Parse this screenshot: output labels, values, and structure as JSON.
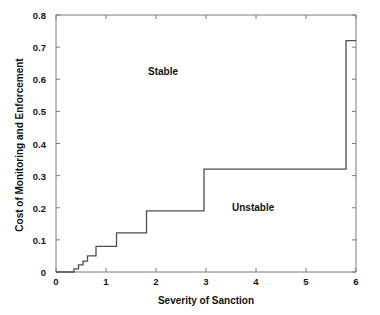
{
  "figure": {
    "width": 380,
    "height": 315,
    "background": "#ffffff",
    "line_color": "#4d4d4d",
    "axis_color": "#7a7a7a",
    "text_color": "#111111"
  },
  "chart_data": {
    "type": "line",
    "subtype": "step",
    "title": "",
    "xlabel": "Severity of Sanction",
    "ylabel": "Cost of Monitoring and Enforcement",
    "xlim": [
      0,
      6
    ],
    "ylim": [
      0,
      0.8
    ],
    "grid": false,
    "legend": null,
    "xticks": [
      0,
      1,
      2,
      3,
      4,
      5,
      6
    ],
    "xtick_labels": [
      "0",
      "1",
      "2",
      "3",
      "4",
      "5",
      "6"
    ],
    "yticks": [
      0,
      0.1,
      0.2,
      0.3,
      0.4,
      0.5,
      0.6,
      0.7,
      0.8
    ],
    "ytick_labels": [
      "0",
      "0.1",
      "0.2",
      "0.3",
      "0.4",
      "0.5",
      "0.6",
      "0.7",
      "0.8"
    ],
    "series": [
      {
        "name": "boundary",
        "step": "post",
        "x": [
          0.0,
          0.36,
          0.45,
          0.54,
          0.63,
          0.8,
          1.21,
          1.81,
          2.96,
          5.8,
          6.0
        ],
        "y": [
          0.0,
          0.01,
          0.022,
          0.034,
          0.05,
          0.08,
          0.122,
          0.19,
          0.32,
          0.72,
          0.72
        ]
      }
    ],
    "annotations": [
      {
        "text": "Stable",
        "x": 1.85,
        "y": 0.605
      },
      {
        "text": "Unstable",
        "x": 3.55,
        "y": 0.26
      }
    ]
  },
  "axis_titles": {
    "x": "Severity of Sanction",
    "y": "Cost of Monitoring and Enforcement"
  },
  "regions": {
    "stable": "Stable",
    "unstable": "Unstable"
  },
  "ticks": {
    "x": [
      "0",
      "1",
      "2",
      "3",
      "4",
      "5",
      "6"
    ],
    "y": [
      "0.8",
      "0.7",
      "0.6",
      "0.5",
      "0.4",
      "0.3",
      "0.2",
      "0.1",
      "0"
    ]
  }
}
